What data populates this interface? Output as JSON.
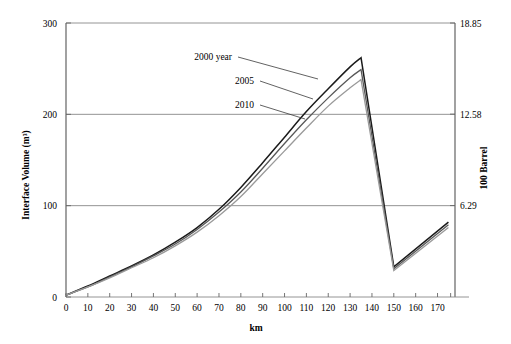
{
  "chart_data": {
    "type": "line",
    "title": "",
    "xlabel": "km",
    "ylabel": "Interface  Volume  (m³)",
    "y2label": "100 Barrel",
    "xlim": [
      0,
      178
    ],
    "ylim": [
      0,
      300
    ],
    "y2lim": [
      0,
      18.85
    ],
    "grid": true,
    "legend_position": "inline-annotations",
    "xticks": [
      0,
      10,
      20,
      30,
      40,
      50,
      60,
      70,
      80,
      90,
      100,
      110,
      120,
      130,
      140,
      150,
      160,
      170
    ],
    "xtick_labels": [
      "0",
      "10",
      "20",
      "30",
      "40",
      "50",
      "60",
      "70",
      "80",
      "90",
      "100",
      "110",
      "120",
      "130",
      "140",
      "150",
      "160",
      "170"
    ],
    "yticks": [
      0,
      100,
      200,
      300
    ],
    "ytick_labels": [
      "0",
      "100",
      "200",
      "300"
    ],
    "y2ticks": [
      6.29,
      12.58,
      18.85
    ],
    "y2tick_labels": [
      "6.29",
      "12.58",
      "18.85"
    ],
    "series": [
      {
        "name": "2000 year",
        "color": "#1a1a1a",
        "x": [
          0,
          10,
          20,
          30,
          40,
          50,
          60,
          70,
          80,
          90,
          100,
          110,
          120,
          130,
          135,
          150,
          175
        ],
        "values": [
          2,
          12,
          23,
          34,
          46,
          60,
          76,
          96,
          120,
          147,
          175,
          203,
          228,
          252,
          262,
          33,
          82
        ]
      },
      {
        "name": "2005",
        "color": "#585858",
        "x": [
          0,
          10,
          20,
          30,
          40,
          50,
          60,
          70,
          80,
          90,
          100,
          110,
          120,
          130,
          135,
          150,
          175
        ],
        "values": [
          2,
          11,
          22,
          33,
          45,
          58,
          74,
          93,
          115,
          141,
          168,
          194,
          218,
          240,
          249,
          31,
          79
        ]
      },
      {
        "name": "2010",
        "color": "#9a9a9a",
        "x": [
          0,
          10,
          20,
          30,
          40,
          50,
          60,
          70,
          80,
          90,
          100,
          110,
          120,
          130,
          135,
          150,
          175
        ],
        "values": [
          2,
          11,
          21,
          32,
          43,
          56,
          71,
          89,
          110,
          135,
          160,
          185,
          209,
          229,
          238,
          29,
          76
        ]
      }
    ],
    "annotations": [
      {
        "text": "2000 year",
        "label_x": 232,
        "label_y": 60,
        "leader_to_x": 318,
        "leader_to_y": 79
      },
      {
        "text": "2005",
        "label_x": 254,
        "label_y": 84,
        "leader_to_x": 313,
        "leader_to_y": 99
      },
      {
        "text": "2010",
        "label_x": 254,
        "label_y": 108,
        "leader_to_x": 305,
        "leader_to_y": 119
      }
    ]
  }
}
